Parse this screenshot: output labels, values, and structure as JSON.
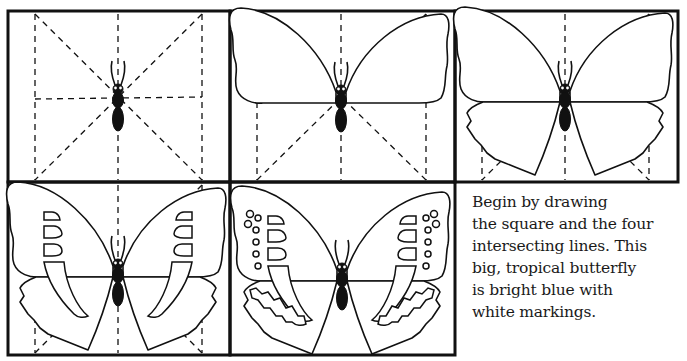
{
  "figure": {
    "panels": [
      {
        "step": 1,
        "description": "Square with intersecting guide lines and butterfly body"
      },
      {
        "step": 2,
        "description": "Upper wings outlined"
      },
      {
        "step": 3,
        "description": "Lower scalloped wings added"
      },
      {
        "step": 4,
        "description": "Wing markings begun"
      },
      {
        "step": 5,
        "description": "Finished butterfly with spots and markings"
      }
    ],
    "colors": {
      "ink": "#111111",
      "paper": "#ffffff"
    }
  },
  "caption": {
    "lines": [
      "Begin by drawing",
      "the square and the four",
      "intersecting lines. This",
      "big, tropical butterfly",
      "is bright blue with",
      "white markings."
    ]
  }
}
